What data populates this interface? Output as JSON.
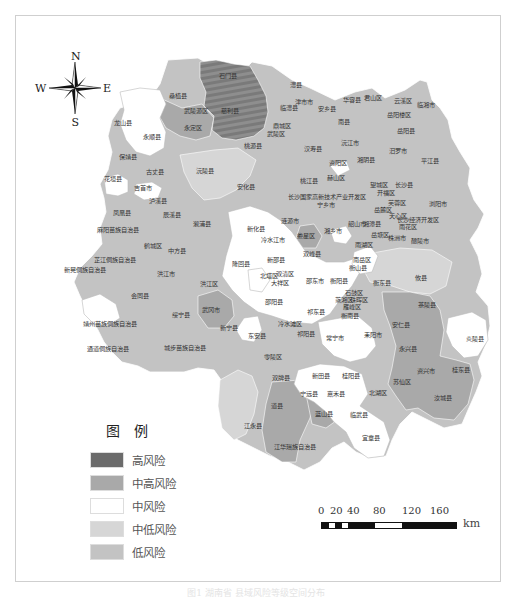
{
  "colors": {
    "high": "#6b6b6b",
    "mid_high": "#a9a9a9",
    "mid": "#ffffff",
    "mid_low": "#d6d6d6",
    "low": "#c3c3c3",
    "border": "#ffffff"
  },
  "compass": {
    "n": "N",
    "s": "S",
    "e": "E",
    "w": "W"
  },
  "legend": {
    "title": "图例",
    "items": [
      {
        "label": "高风险",
        "color": "#6b6b6b"
      },
      {
        "label": "中高风险",
        "color": "#a9a9a9"
      },
      {
        "label": "中风险",
        "color": "#ffffff"
      },
      {
        "label": "中低风险",
        "color": "#d6d6d6"
      },
      {
        "label": "低风险",
        "color": "#c3c3c3"
      }
    ]
  },
  "scale_bar": {
    "ticks": [
      "0",
      "20",
      "40",
      "80",
      "120",
      "160"
    ],
    "unit": "km"
  },
  "counties": [
    {
      "name": "石门县",
      "x": 228,
      "y": 78
    },
    {
      "name": "桑植县",
      "x": 178,
      "y": 98
    },
    {
      "name": "慈利县",
      "x": 230,
      "y": 113
    },
    {
      "name": "武陵源区",
      "x": 196,
      "y": 113
    },
    {
      "name": "永定区",
      "x": 193,
      "y": 130
    },
    {
      "name": "永顺县",
      "x": 152,
      "y": 139
    },
    {
      "name": "龙山县",
      "x": 123,
      "y": 125
    },
    {
      "name": "保靖县",
      "x": 128,
      "y": 159
    },
    {
      "name": "花垣县",
      "x": 113,
      "y": 181
    },
    {
      "name": "古丈县",
      "x": 155,
      "y": 174
    },
    {
      "name": "吉首市",
      "x": 143,
      "y": 190
    },
    {
      "name": "泸溪县",
      "x": 158,
      "y": 203
    },
    {
      "name": "沅陵县",
      "x": 205,
      "y": 173
    },
    {
      "name": "凤凰县",
      "x": 122,
      "y": 215
    },
    {
      "name": "麻阳苗族自治县",
      "x": 118,
      "y": 232
    },
    {
      "name": "辰溪县",
      "x": 172,
      "y": 217
    },
    {
      "name": "溆浦县",
      "x": 202,
      "y": 226
    },
    {
      "name": "鹤城区",
      "x": 153,
      "y": 248
    },
    {
      "name": "中方县",
      "x": 177,
      "y": 253
    },
    {
      "name": "芷江侗族自治县",
      "x": 115,
      "y": 262
    },
    {
      "name": "新晃侗族自治县",
      "x": 85,
      "y": 272
    },
    {
      "name": "洪江市",
      "x": 166,
      "y": 276
    },
    {
      "name": "会同县",
      "x": 140,
      "y": 298
    },
    {
      "name": "洪江区",
      "x": 209,
      "y": 286
    },
    {
      "name": "靖州苗族侗族自治县",
      "x": 110,
      "y": 326
    },
    {
      "name": "绥宁县",
      "x": 181,
      "y": 317
    },
    {
      "name": "武冈市",
      "x": 211,
      "y": 312
    },
    {
      "name": "通道侗族自治县",
      "x": 108,
      "y": 351
    },
    {
      "name": "城步苗族自治县",
      "x": 185,
      "y": 350
    },
    {
      "name": "新宁县",
      "x": 229,
      "y": 330
    },
    {
      "name": "澧县",
      "x": 296,
      "y": 87
    },
    {
      "name": "津市市",
      "x": 304,
      "y": 104
    },
    {
      "name": "临澧县",
      "x": 289,
      "y": 110
    },
    {
      "name": "安乡县",
      "x": 327,
      "y": 111
    },
    {
      "name": "华容县",
      "x": 352,
      "y": 102
    },
    {
      "name": "君山区",
      "x": 373,
      "y": 100
    },
    {
      "name": "云溪区",
      "x": 403,
      "y": 103
    },
    {
      "name": "临湘市",
      "x": 426,
      "y": 107
    },
    {
      "name": "岳阳楼区",
      "x": 399,
      "y": 117
    },
    {
      "name": "鼎城区",
      "x": 282,
      "y": 128
    },
    {
      "name": "武陵区",
      "x": 276,
      "y": 136
    },
    {
      "name": "南县",
      "x": 344,
      "y": 124
    },
    {
      "name": "岳阳县",
      "x": 406,
      "y": 133
    },
    {
      "name": "汉寿县",
      "x": 313,
      "y": 151
    },
    {
      "name": "桃源县",
      "x": 253,
      "y": 148
    },
    {
      "name": "沅江市",
      "x": 350,
      "y": 145
    },
    {
      "name": "湘阴县",
      "x": 366,
      "y": 162
    },
    {
      "name": "汨罗市",
      "x": 398,
      "y": 153
    },
    {
      "name": "平江县",
      "x": 430,
      "y": 163
    },
    {
      "name": "资阳区",
      "x": 338,
      "y": 165
    },
    {
      "name": "赫山区",
      "x": 336,
      "y": 180
    },
    {
      "name": "桃江县",
      "x": 309,
      "y": 183
    },
    {
      "name": "安化县",
      "x": 246,
      "y": 189
    },
    {
      "name": "望城区",
      "x": 379,
      "y": 187
    },
    {
      "name": "长沙县",
      "x": 404,
      "y": 187
    },
    {
      "name": "开福区",
      "x": 386,
      "y": 195
    },
    {
      "name": "长沙国家高新技术产业开发区",
      "x": 327,
      "y": 199
    },
    {
      "name": "宁乡市",
      "x": 326,
      "y": 207
    },
    {
      "name": "芙蓉区",
      "x": 397,
      "y": 205
    },
    {
      "name": "岳麓区",
      "x": 383,
      "y": 212
    },
    {
      "name": "浏阳市",
      "x": 438,
      "y": 206
    },
    {
      "name": "天心区",
      "x": 398,
      "y": 218
    },
    {
      "name": "长沙经济开发区",
      "x": 418,
      "y": 222
    },
    {
      "name": "雨花区",
      "x": 408,
      "y": 229
    },
    {
      "name": "韶山市",
      "x": 357,
      "y": 226
    },
    {
      "name": "湘潭县",
      "x": 372,
      "y": 226
    },
    {
      "name": "湘乡市",
      "x": 333,
      "y": 233
    },
    {
      "name": "新化县",
      "x": 256,
      "y": 231
    },
    {
      "name": "冷水江市",
      "x": 273,
      "y": 242
    },
    {
      "name": "涟源市",
      "x": 290,
      "y": 223
    },
    {
      "name": "娄星区",
      "x": 306,
      "y": 238
    },
    {
      "name": "岳塘区",
      "x": 380,
      "y": 237
    },
    {
      "name": "雨湖区",
      "x": 364,
      "y": 247
    },
    {
      "name": "株洲市",
      "x": 397,
      "y": 240
    },
    {
      "name": "醴陵市",
      "x": 420,
      "y": 243
    },
    {
      "name": "攸县",
      "x": 421,
      "y": 280
    },
    {
      "name": "茶陵县",
      "x": 427,
      "y": 307
    },
    {
      "name": "双峰县",
      "x": 312,
      "y": 256
    },
    {
      "name": "隆回县",
      "x": 241,
      "y": 266
    },
    {
      "name": "新邵县",
      "x": 276,
      "y": 262
    },
    {
      "name": "北塔区",
      "x": 269,
      "y": 278
    },
    {
      "name": "双清区",
      "x": 285,
      "y": 276
    },
    {
      "name": "大祥区",
      "x": 280,
      "y": 285
    },
    {
      "name": "邵东市",
      "x": 315,
      "y": 283
    },
    {
      "name": "邵阳县",
      "x": 274,
      "y": 304
    },
    {
      "name": "南岳区",
      "x": 362,
      "y": 262
    },
    {
      "name": "衡山县",
      "x": 358,
      "y": 270
    },
    {
      "name": "衡东县",
      "x": 382,
      "y": 285
    },
    {
      "name": "衡阳县",
      "x": 339,
      "y": 283
    },
    {
      "name": "石鼓区",
      "x": 354,
      "y": 295
    },
    {
      "name": "蒸湘区",
      "x": 344,
      "y": 302
    },
    {
      "name": "珠晖区",
      "x": 359,
      "y": 302
    },
    {
      "name": "雁峰区",
      "x": 352,
      "y": 309
    },
    {
      "name": "衡南县",
      "x": 350,
      "y": 318
    },
    {
      "name": "祁东县",
      "x": 316,
      "y": 314
    },
    {
      "name": "安仁县",
      "x": 401,
      "y": 327
    },
    {
      "name": "炎陵县",
      "x": 475,
      "y": 341
    },
    {
      "name": "东安县",
      "x": 257,
      "y": 338
    },
    {
      "name": "冷水滩区",
      "x": 290,
      "y": 326
    },
    {
      "name": "祁阳县",
      "x": 306,
      "y": 336
    },
    {
      "name": "常宁市",
      "x": 335,
      "y": 340
    },
    {
      "name": "耒阳市",
      "x": 373,
      "y": 337
    },
    {
      "name": "零陵区",
      "x": 273,
      "y": 359
    },
    {
      "name": "永兴县",
      "x": 408,
      "y": 351
    },
    {
      "name": "资兴市",
      "x": 426,
      "y": 373
    },
    {
      "name": "桂东县",
      "x": 461,
      "y": 372
    },
    {
      "name": "双牌县",
      "x": 281,
      "y": 380
    },
    {
      "name": "新田县",
      "x": 321,
      "y": 378
    },
    {
      "name": "桂阳县",
      "x": 351,
      "y": 378
    },
    {
      "name": "苏仙区",
      "x": 402,
      "y": 384
    },
    {
      "name": "北湖区",
      "x": 378,
      "y": 395
    },
    {
      "name": "宁远县",
      "x": 309,
      "y": 396
    },
    {
      "name": "嘉禾县",
      "x": 336,
      "y": 396
    },
    {
      "name": "道县",
      "x": 277,
      "y": 408
    },
    {
      "name": "汝城县",
      "x": 443,
      "y": 400
    },
    {
      "name": "蓝山县",
      "x": 324,
      "y": 416
    },
    {
      "name": "临武县",
      "x": 359,
      "y": 417
    },
    {
      "name": "江永县",
      "x": 253,
      "y": 428
    },
    {
      "name": "宜章县",
      "x": 371,
      "y": 440
    },
    {
      "name": "江华瑶族自治县",
      "x": 295,
      "y": 449
    }
  ],
  "caption": "图1  湖南省  县域风险等级空间分布"
}
